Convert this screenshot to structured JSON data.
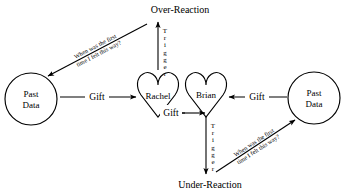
{
  "diagram": {
    "title_top": "Over-Reaction",
    "title_bottom": "Under-Reaction",
    "nodes": {
      "past_data_left": {
        "line1": "Past",
        "line2": "Data",
        "shape": "circle"
      },
      "past_data_right": {
        "line1": "Past",
        "line2": "Data",
        "shape": "circle"
      },
      "person_left": {
        "label": "Rachel",
        "shape": "heart"
      },
      "person_right": {
        "label": "Brian",
        "shape": "heart"
      }
    },
    "edges": {
      "gift_left": "Gift",
      "gift_right": "Gift",
      "gift_middle": "Gift",
      "trigger_top": "Trigger",
      "trigger_bottom": "Trigger",
      "question_top_left_line1": "When was the first",
      "question_top_left_line2": "time I felt this way?",
      "question_bottom_right_line1": "When was the first",
      "question_bottom_right_line2": "time I felt this way?"
    },
    "colors": {
      "stroke": "#000000",
      "background": "#ffffff",
      "text": "#000000"
    }
  }
}
